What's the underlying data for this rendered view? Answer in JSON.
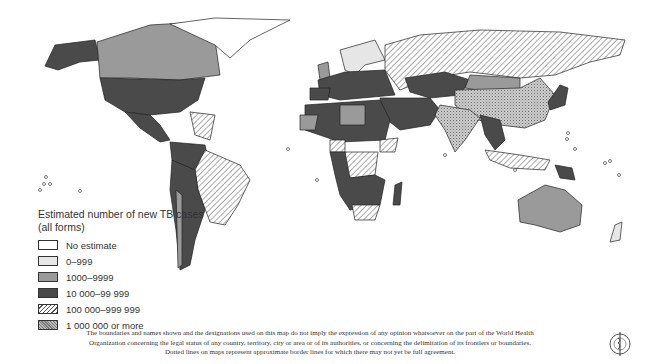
{
  "map": {
    "title": "Estimated number of new TB cases (all forms)",
    "regions": [
      {
        "name": "Alaska / USA",
        "category": "10 000–99 999"
      },
      {
        "name": "Canada",
        "category": "1000–9999"
      },
      {
        "name": "Greenland",
        "category": "No estimate"
      },
      {
        "name": "USA",
        "category": "10 000–99 999"
      },
      {
        "name": "Mexico",
        "category": "10 000–99 999"
      },
      {
        "name": "Brazil",
        "category": "100 000–999 999"
      },
      {
        "name": "Western South America",
        "category": "10 000–99 999"
      },
      {
        "name": "Argentina",
        "category": "10 000–99 999"
      },
      {
        "name": "Russia",
        "category": "100 000–999 999"
      },
      {
        "name": "China",
        "category": "1 000 000 or more"
      },
      {
        "name": "India",
        "category": "1 000 000 or more"
      },
      {
        "name": "Mongolia",
        "category": "1000–9999"
      },
      {
        "name": "Kazakhstan",
        "category": "10 000–99 999"
      },
      {
        "name": "Japan",
        "category": "10 000–99 999"
      },
      {
        "name": "Australia",
        "category": "1000–9999"
      },
      {
        "name": "Northern Europe",
        "category": "0–999"
      },
      {
        "name": "North Africa",
        "category": "10 000–99 999"
      },
      {
        "name": "Libya",
        "category": "1000–9999"
      },
      {
        "name": "Nigeria",
        "category": "100 000–999 999"
      },
      {
        "name": "DR Congo",
        "category": "100 000–999 999"
      },
      {
        "name": "Ethiopia",
        "category": "100 000–999 999"
      },
      {
        "name": "South Africa",
        "category": "100 000–999 999"
      },
      {
        "name": "Indonesia",
        "category": "100 000–999 999"
      },
      {
        "name": "Southeast Asia",
        "category": "10 000–99 999"
      },
      {
        "name": "New Zealand",
        "category": "0–999"
      }
    ]
  },
  "legend": {
    "title": "Estimated number of new TB cases (all forms)",
    "items": [
      {
        "label": "No estimate",
        "fill": "#ffffff",
        "pattern": "none"
      },
      {
        "label": "0–999",
        "fill": "#e6e6e6",
        "pattern": "none"
      },
      {
        "label": "1000–9999",
        "fill": "#9a9a9a",
        "pattern": "none"
      },
      {
        "label": "10 000–99 999",
        "fill": "#4a4a4a",
        "pattern": "none"
      },
      {
        "label": "100 000–999 999",
        "fill": "#ffffff",
        "pattern": "diagonal-hatch"
      },
      {
        "label": "1 000 000 or more",
        "fill": "#bcbcbc",
        "pattern": "crosshatch"
      }
    ]
  },
  "footer": {
    "line1": "The boundaries and names shown and the designations used on this map do not imply the expression of any opinion whatsoever on the part of the World Health",
    "line2": "Organization concerning the legal status of any country, territory, city or area or of its authorities, or concerning the delimitation of its frontiers or boundaries.",
    "line3": "Dotted lines on maps represent approximate border lines for which there may not yet be full agreement."
  },
  "emblem": {
    "name": "WHO emblem"
  }
}
